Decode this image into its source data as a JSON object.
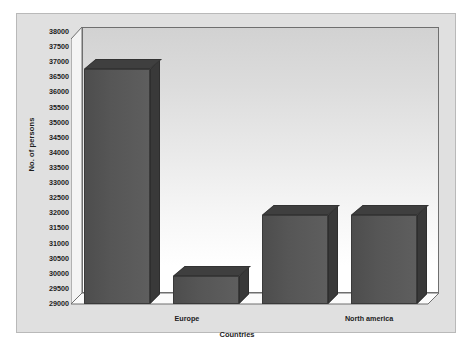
{
  "chart_data": {
    "type": "bar",
    "title": "",
    "xlabel": "Countries",
    "ylabel": "No. of persons",
    "categories": [
      "",
      "Europe",
      "",
      "North america"
    ],
    "values": [
      36950,
      29950,
      32000,
      32000
    ],
    "ylim": [
      29000,
      38000
    ],
    "ytick_step": 500,
    "yticks": [
      "38000",
      "37500",
      "37000",
      "36500",
      "36000",
      "35500",
      "35000",
      "34500",
      "34000",
      "33500",
      "33000",
      "32500",
      "32000",
      "31500",
      "31000",
      "30500",
      "30000",
      "29500",
      "29000"
    ],
    "visible_xticks": [
      {
        "label": "Europe",
        "position_pct": 31.5
      },
      {
        "label": "North america",
        "position_pct": 81.0
      }
    ],
    "grid": false,
    "legend": false,
    "style": "3d-column",
    "colors": {
      "bar_front": "#565656",
      "bar_top": "#3f3f3f",
      "bar_side": "#393939",
      "plot_background_top": "#d2d2d2",
      "plot_background_bottom": "#ffffff",
      "chart_background": "#e0e0e0",
      "frame_border": "#b9b9b9",
      "axis_line": "#6f6f6f",
      "text": "#1c1c1c"
    }
  }
}
